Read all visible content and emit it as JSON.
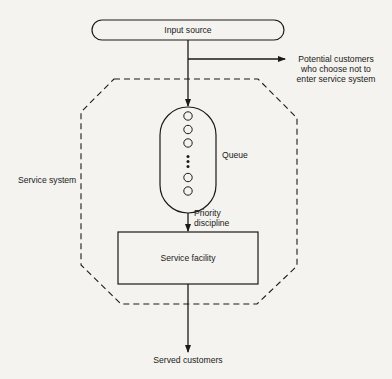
{
  "diagram": {
    "nodes": {
      "input_source": "Input source",
      "queue": "Queue",
      "service_facility": "Service facility",
      "service_system": "Service system",
      "served_customers": "Served customers"
    },
    "balk_label": {
      "line1": "Potential customers",
      "line2": "who choose not to",
      "line3": "enter service system"
    },
    "priority_label": {
      "line1": "Priority",
      "line2": "discipline"
    },
    "queue_items": 5,
    "colors": {
      "background": "#f4f3ef",
      "stroke": "#1a1a1a"
    }
  }
}
